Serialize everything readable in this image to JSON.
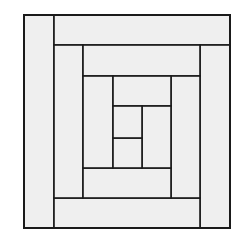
{
  "diagram": {
    "type": "log-cabin-quilt-block",
    "colors": {
      "fill": "#efefef",
      "stroke": "#1a1a1a",
      "background": "#ffffff"
    },
    "outer": {
      "x": 24,
      "y": 15,
      "w": 206,
      "h": 213
    },
    "patches": [
      {
        "id": "left-strip-outer",
        "x": 24,
        "y": 15,
        "w": 30,
        "h": 213
      },
      {
        "id": "top-strip-outer",
        "x": 54,
        "y": 15,
        "w": 176,
        "h": 30
      },
      {
        "id": "right-strip-outer",
        "x": 200,
        "y": 45,
        "w": 30,
        "h": 183
      },
      {
        "id": "bottom-strip-outer",
        "x": 54,
        "y": 198,
        "w": 146,
        "h": 30
      },
      {
        "id": "left-strip-mid",
        "x": 54,
        "y": 45,
        "w": 29,
        "h": 153
      },
      {
        "id": "top-strip-mid",
        "x": 83,
        "y": 45,
        "w": 117,
        "h": 31
      },
      {
        "id": "right-strip-mid",
        "x": 171,
        "y": 76,
        "w": 29,
        "h": 122
      },
      {
        "id": "bottom-strip-mid",
        "x": 83,
        "y": 168,
        "w": 88,
        "h": 30
      },
      {
        "id": "left-strip-inner",
        "x": 83,
        "y": 76,
        "w": 30,
        "h": 92
      },
      {
        "id": "top-strip-inner",
        "x": 113,
        "y": 76,
        "w": 58,
        "h": 30
      },
      {
        "id": "right-strip-inner",
        "x": 142,
        "y": 106,
        "w": 29,
        "h": 62
      },
      {
        "id": "bottom-strip-inner",
        "x": 113,
        "y": 138,
        "w": 29,
        "h": 30
      },
      {
        "id": "center-square",
        "x": 113,
        "y": 106,
        "w": 29,
        "h": 32
      }
    ]
  }
}
